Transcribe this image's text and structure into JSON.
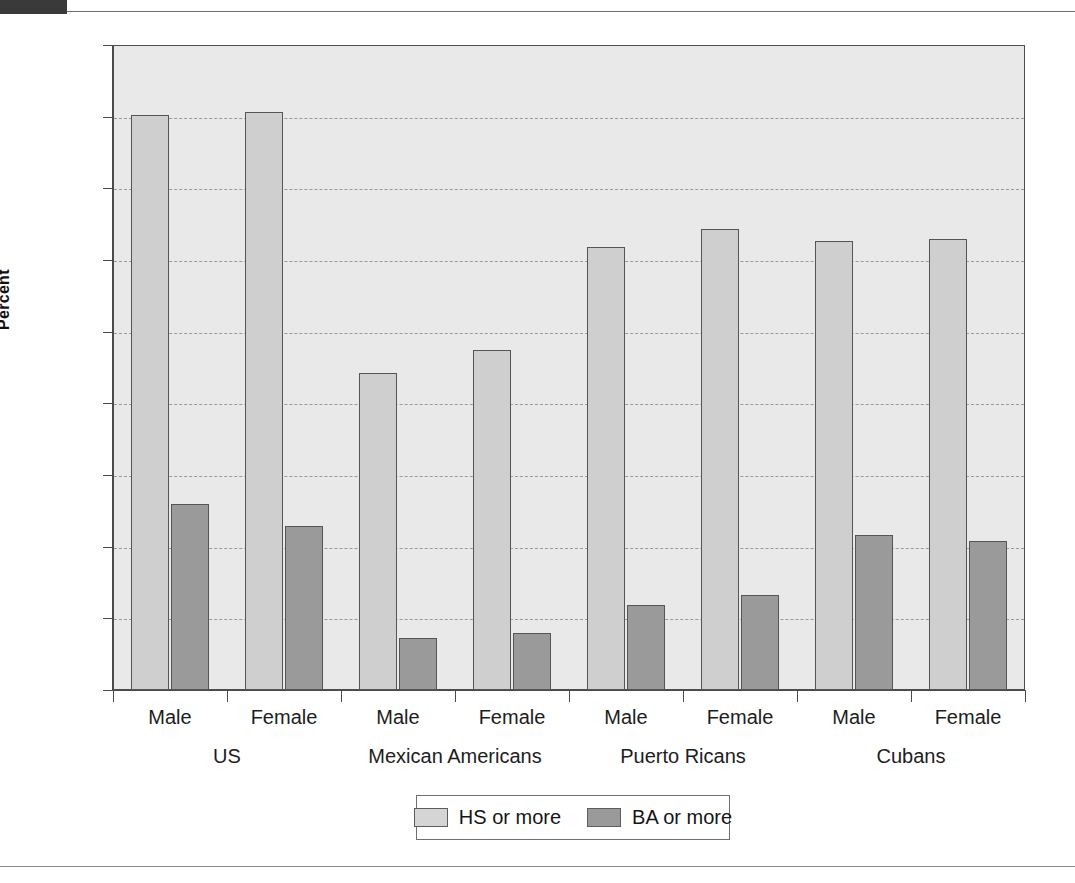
{
  "chart_data": {
    "type": "bar",
    "title": "",
    "xlabel": "",
    "ylabel": "Percent",
    "ylim": [
      0,
      90
    ],
    "yticks": [
      0,
      10,
      20,
      30,
      40,
      50,
      60,
      70,
      80,
      90
    ],
    "ytick_labels": [
      "0",
      "10",
      "20",
      "30",
      "40",
      "50",
      "60",
      "70",
      "80",
      "90"
    ],
    "grid": true,
    "legend_position": "bottom-center",
    "groups": [
      "US",
      "Mexican Americans",
      "Puerto Ricans",
      "Cubans"
    ],
    "subgroups": [
      "Male",
      "Female"
    ],
    "categories": [
      "US Male",
      "US Female",
      "Mexican Americans Male",
      "Mexican Americans Female",
      "Puerto Ricans Male",
      "Puerto Ricans Female",
      "Cubans Male",
      "Cubans Female"
    ],
    "series": [
      {
        "name": "HS or more",
        "color": "#cfcfcf",
        "values": [
          80.2,
          80.7,
          44.3,
          47.4,
          61.8,
          64.3,
          62.7,
          63.0
        ]
      },
      {
        "name": "BA or more",
        "color": "#9a9a9a",
        "values": [
          26.0,
          22.9,
          7.2,
          7.9,
          11.8,
          13.2,
          21.6,
          20.8
        ]
      }
    ]
  },
  "axis": {
    "y_title": "Percent",
    "y_ticks": [
      "90",
      "80",
      "70",
      "60",
      "50",
      "40",
      "30",
      "20",
      "10",
      "0"
    ]
  },
  "x_labels": {
    "subgroups": [
      "Male",
      "Female",
      "Male",
      "Female",
      "Male",
      "Female",
      "Male",
      "Female"
    ],
    "groups": [
      "US",
      "Mexican Americans",
      "Puerto Ricans",
      "Cubans"
    ]
  },
  "legend": {
    "items": [
      {
        "label": "HS or more",
        "swatch": "light-gray-swatch"
      },
      {
        "label": "BA or more",
        "swatch": "dark-gray-swatch"
      }
    ]
  },
  "colors": {
    "hs_fill": "#cfcfcf",
    "ba_fill": "#9a9a9a",
    "plot_background": "#e9e9e9",
    "axis": "#4a4a4a",
    "gridline": "#9a9a9a"
  }
}
